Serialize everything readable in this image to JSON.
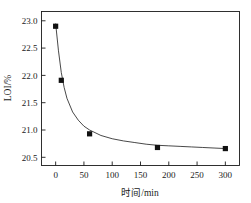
{
  "chart_data": {
    "type": "scatter",
    "title": "",
    "xlabel": "时间/min",
    "ylabel": "LOI/%",
    "xlim": [
      -25,
      325
    ],
    "ylim": [
      20.35,
      23.17
    ],
    "xticks": [
      0,
      50,
      100,
      150,
      200,
      250,
      300
    ],
    "xtick_labels": [
      "0",
      "50",
      "100",
      "150",
      "200",
      "250",
      "300"
    ],
    "yticks": [
      20.5,
      21.0,
      21.5,
      22.0,
      22.5,
      23.0
    ],
    "ytick_labels": [
      "20.5",
      "21.0",
      "21.5",
      "22.0",
      "22.5",
      "23.0"
    ],
    "grid": false,
    "legend": null,
    "series": [
      {
        "name": "LOI",
        "marker": "filled-square",
        "marker_color": "#111111",
        "x": [
          0,
          10,
          60,
          180,
          300
        ],
        "y": [
          22.9,
          21.91,
          20.93,
          20.68,
          20.66
        ]
      },
      {
        "name": "fitted curve",
        "type": "line",
        "line_color": "#1a1a1a",
        "x": [
          0,
          5,
          10,
          15,
          20,
          30,
          40,
          50,
          60,
          80,
          100,
          120,
          140,
          160,
          180,
          200,
          220,
          240,
          260,
          280,
          300
        ],
        "y": [
          22.95,
          22.45,
          22.05,
          21.78,
          21.58,
          21.33,
          21.18,
          21.07,
          21.0,
          20.9,
          20.84,
          20.8,
          20.77,
          20.74,
          20.72,
          20.71,
          20.7,
          20.69,
          20.68,
          20.67,
          20.66
        ]
      }
    ]
  },
  "axes": {
    "y_title": "LOI/%",
    "x_title": "时间/min"
  }
}
